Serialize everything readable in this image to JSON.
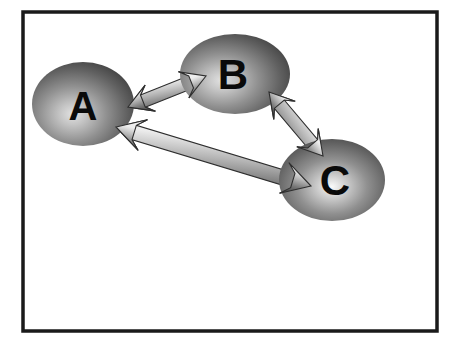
{
  "figure": {
    "canvas": {
      "width": 451,
      "height": 347,
      "background": "#ffffff"
    },
    "frame": {
      "name": "figure-border",
      "x": 23,
      "y": 12,
      "width": 414,
      "height": 319,
      "stroke": "#1a1a1a",
      "stroke_width": 3.5,
      "fill": "#ffffff"
    },
    "style": {
      "node_fill_light": "#d8d8d8",
      "node_fill_mid": "#8c8c8c",
      "node_fill_dark": "#4a4a4a",
      "node_fill_edge": "#3a3a3a",
      "label_color": "#0a0a0a",
      "arrow_light": "#f2f2f2",
      "arrow_mid": "#b4b4b4",
      "arrow_dark": "#4f4f4f",
      "arrow_outline": "#2e2e2e"
    }
  },
  "nodes": [
    {
      "id": "A",
      "label": "A",
      "cx": 83,
      "cy": 104,
      "rx": 51,
      "ry": 42,
      "font_size": 40,
      "highlight_x": 40,
      "highlight_y": 62,
      "label_dx": 0,
      "label_dy": 2
    },
    {
      "id": "B",
      "label": "B",
      "cx": 235,
      "cy": 74,
      "rx": 55,
      "ry": 40,
      "font_size": 42,
      "highlight_x": 38,
      "highlight_y": 58,
      "label_dx": -2,
      "label_dy": 0
    },
    {
      "id": "C",
      "label": "C",
      "cx": 332,
      "cy": 180,
      "rx": 53,
      "ry": 41,
      "font_size": 42,
      "highlight_x": 50,
      "highlight_y": 58,
      "label_dx": 3,
      "label_dy": 0
    }
  ],
  "edges": [
    {
      "id": "A-B",
      "from": "A",
      "to": "B",
      "kind": "double-headed-arrow",
      "x1": 128,
      "y1": 107,
      "x2": 206,
      "y2": 76,
      "half_width": 6.5,
      "head_length": 24,
      "head_half_width": 14,
      "barb_inset": 8
    },
    {
      "id": "B-C",
      "from": "B",
      "to": "C",
      "kind": "double-headed-arrow",
      "x1": 269,
      "y1": 92,
      "x2": 323,
      "y2": 156,
      "half_width": 6.5,
      "head_length": 24,
      "head_half_width": 14,
      "barb_inset": 8
    },
    {
      "id": "A-C",
      "from": "A",
      "to": "C",
      "kind": "double-headed-arrow",
      "x1": 116,
      "y1": 127,
      "x2": 311,
      "y2": 186,
      "half_width": 7.5,
      "head_length": 28,
      "head_half_width": 16,
      "barb_inset": 9
    }
  ]
}
